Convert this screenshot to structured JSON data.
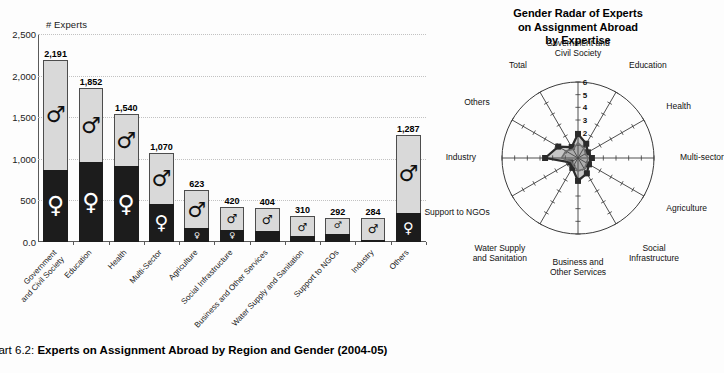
{
  "caption": {
    "number": "hart 6.2:",
    "title": "Experts on Assignment Abroad by Region and Gender (2004-05)"
  },
  "bar_chart": {
    "axis_title": "# Experts",
    "male_symbol": "♂",
    "female_symbol": "♀"
  },
  "radar_chart": {
    "title_line1": "Gender Radar of Experts",
    "title_line2": "on Assignment Abroad",
    "title_line3": "by Expertise"
  },
  "chart_data": [
    {
      "type": "bar",
      "title": "Experts on Assignment Abroad by Region and Gender (2004-05)",
      "subtype": "stacked-bar",
      "xlabel": "",
      "ylabel": "# Experts",
      "ylim": [
        0,
        2500
      ],
      "yticks": [
        "0.0",
        "500",
        "1,000",
        "1,500",
        "2,000",
        "2,500"
      ],
      "ytick_values": [
        0,
        500,
        1000,
        1500,
        2000,
        2500
      ],
      "grid": true,
      "categories": [
        "Government and Civil Society",
        "Education",
        "Health",
        "Multi-Sector",
        "Agriculture",
        "Social Infrastructure",
        "Business and Other Services",
        "Water Supply and Sanitation",
        "Support to NGOs",
        "Industry",
        "Others"
      ],
      "category_lines": [
        [
          "Government",
          "and Civil Society"
        ],
        [
          "Education"
        ],
        [
          "Health"
        ],
        [
          "Multi-Sector"
        ],
        [
          "Agriculture"
        ],
        [
          "Social Infrastructure"
        ],
        [
          "Business and Other Services"
        ],
        [
          "Water Supply and Sanitation"
        ],
        [
          "Support to NGOs"
        ],
        [
          "Industry"
        ],
        [
          "Others"
        ]
      ],
      "totals": [
        2191,
        1852,
        1540,
        1070,
        623,
        420,
        404,
        310,
        292,
        284,
        1287
      ],
      "total_labels": [
        "2,191",
        "1,852",
        "1,540",
        "1,070",
        "623",
        "420",
        "404",
        "310",
        "292",
        "284",
        "1,287"
      ],
      "series": [
        {
          "name": "Female",
          "symbol": "♀",
          "color": "#1c1c1c",
          "values": [
            870,
            960,
            910,
            460,
            165,
            150,
            130,
            70,
            95,
            25,
            350
          ]
        },
        {
          "name": "Male",
          "symbol": "♂",
          "color": "#d9d9d9",
          "values": [
            1321,
            892,
            630,
            610,
            458,
            270,
            274,
            240,
            197,
            259,
            937
          ]
        }
      ]
    },
    {
      "type": "radar",
      "title": "Gender Radar of Experts on Assignment Abroad by Expertise",
      "rlim": [
        0,
        6
      ],
      "rticks": [
        2,
        3,
        4,
        5,
        6
      ],
      "grid": true,
      "categories": [
        "Government and Civil Society",
        "Education",
        "Health",
        "Multi-sector",
        "Agriculture",
        "Social Infrastructure",
        "Business and Other Services",
        "Water Supply and Sanitation",
        "Support to NGOs",
        "Industry",
        "Others",
        "Total"
      ],
      "category_lines": [
        [
          "Government and",
          "Civil Society"
        ],
        [
          "Education"
        ],
        [
          "Health"
        ],
        [
          "Multi-sector"
        ],
        [
          "Agriculture"
        ],
        [
          "Social",
          "Infrastructure"
        ],
        [
          "Business and",
          "Other Services"
        ],
        [
          "Water Supply",
          "and Sanitation"
        ],
        [
          "Support to NGOs"
        ],
        [
          "Industry"
        ],
        [
          "Others"
        ],
        [
          "Total"
        ]
      ],
      "series": [
        {
          "name": "Series 1",
          "color": "#2b2b2b",
          "values": [
            1.9,
            1.3,
            0.9,
            1.1,
            1.0,
            1.4,
            1.8,
            0.9,
            0.7,
            2.6,
            1.8,
            1.0
          ]
        },
        {
          "name": "Series 2",
          "color": "#6e6e6e",
          "values": [
            1.2,
            0.9,
            0.7,
            0.8,
            0.8,
            1.0,
            1.0,
            0.7,
            0.6,
            1.3,
            1.1,
            0.8
          ]
        }
      ]
    }
  ]
}
